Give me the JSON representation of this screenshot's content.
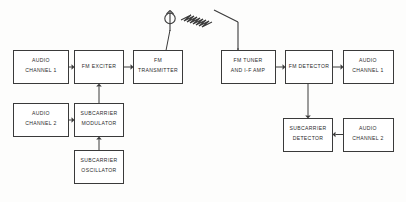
{
  "diagram": {
    "colors": {
      "background": "#fdfdfc",
      "stroke": "#3a3a3a",
      "box_fill": "#ffffff",
      "text": "#2b2b2b"
    },
    "transmitter_section": {
      "blocks": [
        {
          "id": "audio-channel-1-tx",
          "line1": "AUDIO",
          "line2": "CHANNEL 1",
          "x": 13,
          "y": 50,
          "w": 55,
          "h": 33
        },
        {
          "id": "fm-exciter",
          "line1": "FM EXCITER",
          "line2": "",
          "x": 74,
          "y": 50,
          "w": 49,
          "h": 33
        },
        {
          "id": "fm-transmitter",
          "line1": "FM",
          "line2": "TRANSMITTER",
          "x": 133,
          "y": 50,
          "w": 49,
          "h": 33
        },
        {
          "id": "audio-channel-2-tx",
          "line1": "AUDIO",
          "line2": "CHANNEL 2",
          "x": 13,
          "y": 103,
          "w": 55,
          "h": 33
        },
        {
          "id": "subcarrier-modulator",
          "line1": "SUBCARRIER",
          "line2": "MODULATOR",
          "x": 74,
          "y": 103,
          "w": 49,
          "h": 33
        },
        {
          "id": "subcarrier-oscillator",
          "line1": "SUBCARRIER",
          "line2": "OSCILLATOR",
          "x": 74,
          "y": 150,
          "w": 49,
          "h": 33
        }
      ]
    },
    "receiver_section": {
      "blocks": [
        {
          "id": "fm-tuner-if-amp",
          "line1": "FM TUNER",
          "line2": "AND  I-F AMP",
          "x": 221,
          "y": 50,
          "w": 54,
          "h": 33
        },
        {
          "id": "fm-detector",
          "line1": "FM DETECTOR",
          "line2": "",
          "x": 285,
          "y": 50,
          "w": 47,
          "h": 33
        },
        {
          "id": "audio-channel-1-rx",
          "line1": "AUDIO",
          "line2": "CHANNEL 1",
          "x": 343,
          "y": 50,
          "w": 50,
          "h": 33
        },
        {
          "id": "subcarrier-detector",
          "line1": "SUBCARRIER",
          "line2": "DETECTOR",
          "x": 283,
          "y": 118,
          "w": 49,
          "h": 33
        },
        {
          "id": "audio-channel-2-rx",
          "line1": "AUDIO",
          "line2": "CHANNEL 2",
          "x": 343,
          "y": 118,
          "w": 50,
          "h": 33
        }
      ]
    },
    "antennas": {
      "transmit": {
        "name": "transmit-antenna",
        "mast_x": 170,
        "mast_top": 22,
        "mast_bottom": 50
      },
      "receive": {
        "name": "receive-antenna",
        "mast_x": 238,
        "mast_top": 18,
        "mast_bottom": 50
      },
      "rf_wave_label": "radio-wave-symbol"
    }
  }
}
